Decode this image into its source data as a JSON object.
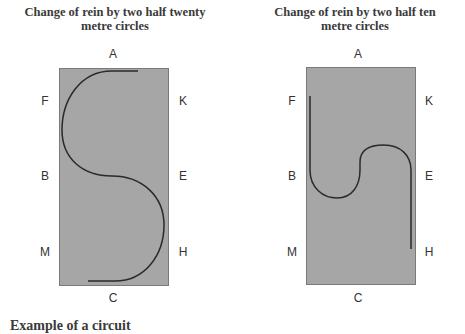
{
  "diagrams": [
    {
      "title": "Change of rein by two half twenty metre circles",
      "title_line1": "Change of rein by two half twenty",
      "title_line2": "metre circles",
      "markers": {
        "A": "A",
        "F": "F",
        "K": "K",
        "B": "B",
        "E": "E",
        "M": "M",
        "H": "H",
        "C": "C"
      }
    },
    {
      "title": "Change of rein by two half ten metre circles",
      "title_line1": "Change of rein by two half ten",
      "title_line2": "metre circles",
      "markers": {
        "A": "A",
        "F": "F",
        "K": "K",
        "B": "B",
        "E": "E",
        "M": "M",
        "H": "H",
        "C": "C"
      }
    }
  ],
  "colors": {
    "arena": "#a6a6a6",
    "path": "#2a2a2a",
    "text": "#333333"
  },
  "footer_text": "Example of a circuit"
}
